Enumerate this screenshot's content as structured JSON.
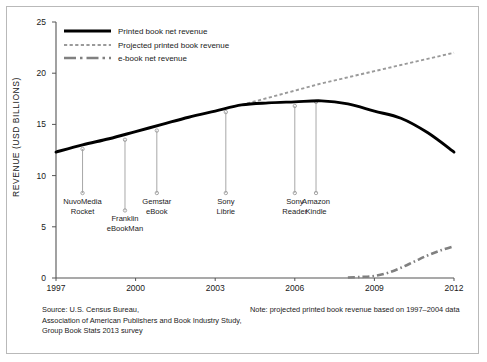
{
  "chart_data": {
    "type": "line",
    "title": "",
    "xlabel": "",
    "ylabel": "REVENUE (USD BILLIONS)",
    "xlim": [
      1997,
      2012
    ],
    "ylim": [
      0,
      25
    ],
    "grid": false,
    "legend_position": "top-left",
    "x_ticks": [
      "1997",
      "2000",
      "2003",
      "2006",
      "2009",
      "2012"
    ],
    "x_tick_values": [
      1997,
      2000,
      2003,
      2006,
      2009,
      2012
    ],
    "y_ticks": [
      "0",
      "5",
      "10",
      "15",
      "20",
      "25"
    ],
    "y_tick_values": [
      0,
      5,
      10,
      15,
      20,
      25
    ],
    "series": [
      {
        "name": "Printed book net revenue",
        "style": "solid",
        "color": "#000000",
        "x": [
          1997,
          1998,
          1999,
          2000,
          2001,
          2002,
          2003,
          2004,
          2005,
          2006,
          2007,
          2008,
          2009,
          2010,
          2011,
          2012
        ],
        "values": [
          12.3,
          13.0,
          13.6,
          14.3,
          15.0,
          15.7,
          16.3,
          16.9,
          17.1,
          17.2,
          17.3,
          17.0,
          16.3,
          15.6,
          14.2,
          12.3
        ]
      },
      {
        "name": "Projected printed book revenue",
        "style": "dashed",
        "color": "#9a9a9a",
        "x": [
          2004,
          2005,
          2006,
          2007,
          2008,
          2009,
          2010,
          2011,
          2012
        ],
        "values": [
          16.9,
          17.6,
          18.3,
          19.0,
          19.6,
          20.2,
          20.8,
          21.4,
          22.0
        ]
      },
      {
        "name": "e-book net revenue",
        "style": "dash-dot",
        "color": "#808080",
        "x": [
          2008,
          2008.5,
          2009,
          2009.5,
          2010,
          2010.5,
          2011,
          2011.5,
          2012
        ],
        "values": [
          0.05,
          0.1,
          0.2,
          0.5,
          1.0,
          1.6,
          2.2,
          2.7,
          3.1
        ]
      }
    ],
    "annotations": [
      {
        "label_line1": "NuvoMedia",
        "label_line2": "Rocket",
        "year": 1998.0,
        "marker_value": 12.6,
        "label_value": 8.3
      },
      {
        "label_line1": "Franklin",
        "label_line2": "eBookMan",
        "year": 1999.6,
        "marker_value": 13.5,
        "label_value": 6.6
      },
      {
        "label_line1": "Gemstar",
        "label_line2": "eBook",
        "year": 2000.8,
        "marker_value": 14.4,
        "label_value": 8.3
      },
      {
        "label_line1": "Sony",
        "label_line2": "Librie",
        "year": 2003.4,
        "marker_value": 16.2,
        "label_value": 8.3
      },
      {
        "label_line1": "Sony",
        "label_line2": "Reader",
        "year": 2006.0,
        "marker_value": 16.8,
        "label_value": 8.3
      },
      {
        "label_line1": "Amazon",
        "label_line2": "Kindle",
        "year": 2006.8,
        "marker_value": 17.2,
        "label_value": 8.3
      }
    ]
  },
  "legend": {
    "items": [
      {
        "label": "Printed book net revenue"
      },
      {
        "label": "Projected printed book revenue"
      },
      {
        "label": "e-book net revenue"
      }
    ]
  },
  "footer": {
    "source_line1": "Source: U.S. Census Bureau,",
    "source_line2": "Association of American Publishers and Book Industry Study,",
    "source_line3": "Group Book Stats 2013 survey",
    "note": "Note:  projected printed book revenue based on 1997–2004 data"
  },
  "colors": {
    "printed": "#000000",
    "projected": "#9a9a9a",
    "ebook": "#808080",
    "axis": "#555555",
    "frame": "#b9b9b9",
    "text": "#1a1a1a"
  }
}
